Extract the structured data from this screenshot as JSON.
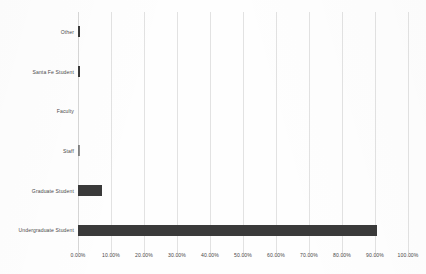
{
  "chart_data": {
    "type": "bar",
    "orientation": "horizontal",
    "title": "",
    "xlabel": "",
    "ylabel": "",
    "xlim": [
      0,
      100
    ],
    "grid": true,
    "legend": false,
    "bar_color": "#3a3a3a",
    "gridline_color": "#e2e2e2",
    "categories": [
      "Other",
      "Santa Fe Student",
      "Faculty",
      "Staff",
      "Graduate Student",
      "Undergraduate Student"
    ],
    "values": [
      0.5,
      0.7,
      0.0,
      0.2,
      7.2,
      90.5
    ],
    "value_labels": [
      "0.50%",
      "0.70%",
      "0.00%",
      "0.20%",
      "7.20%",
      "90.50%"
    ],
    "xticks": [
      0,
      10,
      20,
      30,
      40,
      50,
      60,
      70,
      80,
      90,
      100
    ],
    "xtick_labels": [
      "0.00%",
      "10.00%",
      "20.00%",
      "30.00%",
      "40.00%",
      "50.00%",
      "60.00%",
      "70.00%",
      "80.00%",
      "90.00%",
      "100.00%"
    ]
  }
}
